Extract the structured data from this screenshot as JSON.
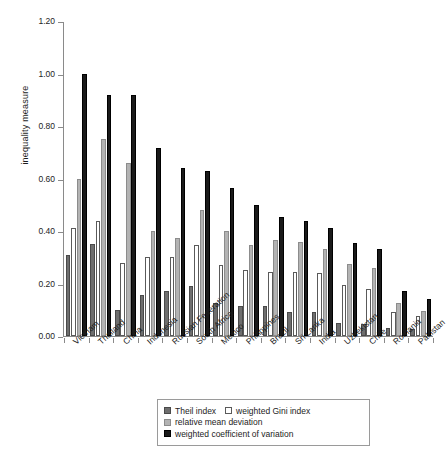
{
  "chart_data": {
    "type": "bar",
    "title": "",
    "xlabel": "",
    "ylabel": "inequality measure",
    "ylim": [
      0.0,
      1.2
    ],
    "yticks": [
      "0.00",
      "0.20",
      "0.40",
      "0.60",
      "0.80",
      "1.00",
      "1.20"
    ],
    "grid": false,
    "legend_position": "bottom",
    "categories": [
      "Vietnam",
      "Thailand",
      "China",
      "Indonesia",
      "Russian Federation",
      "South Africa",
      "Mexico",
      "Philippines",
      "Brazil",
      "Sri Lanka",
      "India",
      "Uzbekistan",
      "Chile",
      "Romania",
      "Pakistan"
    ],
    "series": [
      {
        "name": "Theil index",
        "color": "#6e6e6e",
        "values": [
          0.31,
          0.35,
          0.1,
          0.155,
          0.17,
          0.19,
          0.125,
          0.115,
          0.115,
          0.09,
          0.09,
          0.05,
          0.045,
          0.03,
          0.025
        ]
      },
      {
        "name": "weighted Gini index",
        "color": "#ffffff",
        "values": [
          0.41,
          0.44,
          0.28,
          0.3,
          0.3,
          0.345,
          0.27,
          0.25,
          0.245,
          0.245,
          0.24,
          0.195,
          0.18,
          0.09,
          0.075
        ]
      },
      {
        "name": "relative mean deviation",
        "color": "#b3b3b3",
        "values": [
          0.6,
          0.75,
          0.66,
          0.4,
          0.375,
          0.48,
          0.4,
          0.345,
          0.365,
          0.36,
          0.33,
          0.275,
          0.26,
          0.125,
          0.095
        ]
      },
      {
        "name": "weighted coefficient of variation",
        "color": "#1a1a1a",
        "values": [
          1.0,
          0.92,
          0.92,
          0.715,
          0.64,
          0.63,
          0.565,
          0.5,
          0.455,
          0.44,
          0.41,
          0.355,
          0.33,
          0.17,
          0.14
        ]
      }
    ]
  },
  "legend": {
    "items": [
      "Theil index",
      "weighted Gini index",
      "relative mean deviation",
      "weighted coefficient of variation"
    ]
  }
}
